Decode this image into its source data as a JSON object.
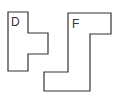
{
  "diagram": {
    "shapes": [
      {
        "id": "D",
        "label": "D",
        "points": "8,12 28,12 28,33 48,33 48,54 28,54 28,71 8,71",
        "label_x": 11,
        "label_y": 26
      },
      {
        "id": "F",
        "label": "F",
        "points": "68,13 111,13 111,34 90,34 90,91 44,91 44,72 68,72",
        "label_x": 72,
        "label_y": 28
      }
    ],
    "stroke_color": "#333333",
    "background": "#ffffff"
  }
}
